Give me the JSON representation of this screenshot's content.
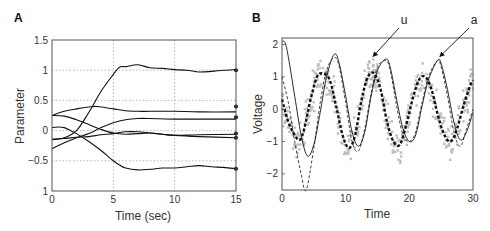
{
  "chart_data": [
    {
      "type": "line",
      "panel_label": "A",
      "title": "",
      "xlabel": "Time (sec)",
      "ylabel": "Parameter",
      "xlim": [
        0,
        15
      ],
      "ylim": [
        -1,
        1.5
      ],
      "xticks": [
        0,
        5,
        10,
        15
      ],
      "xtick_labels": [
        "0",
        "5",
        "10",
        "15"
      ],
      "yticks": [
        -1,
        -0.5,
        0,
        0.5,
        1,
        1.5
      ],
      "ytick_labels": [
        "1",
        "−0.5",
        "0",
        "0.5",
        "1",
        "1.5"
      ],
      "grid": true,
      "series": [
        {
          "name": "p1",
          "x": [
            0,
            1,
            2,
            3,
            4,
            5,
            5.5,
            6,
            7,
            8,
            9,
            10,
            11,
            12,
            13,
            14,
            15
          ],
          "y": [
            -0.15,
            -0.12,
            0.0,
            0.3,
            0.65,
            0.93,
            1.05,
            1.06,
            1.09,
            1.04,
            1.03,
            1.01,
            1.0,
            0.97,
            0.98,
            1.0,
            1.01
          ],
          "final": 1.0
        },
        {
          "name": "p2",
          "x": [
            0,
            1,
            2,
            3,
            3.5,
            4,
            5,
            6,
            7,
            8,
            10,
            12,
            15
          ],
          "y": [
            0.25,
            0.32,
            0.36,
            0.39,
            0.4,
            0.39,
            0.36,
            0.33,
            0.32,
            0.32,
            0.32,
            0.31,
            0.31
          ],
          "final": 0.4
        },
        {
          "name": "p3",
          "x": [
            0,
            1,
            2,
            3,
            4,
            5,
            6,
            7,
            8,
            10,
            12,
            15
          ],
          "y": [
            -0.3,
            -0.2,
            -0.12,
            -0.05,
            0.05,
            0.13,
            0.18,
            0.2,
            0.2,
            0.19,
            0.19,
            0.19
          ],
          "final": 0.22
        },
        {
          "name": "p4",
          "x": [
            0,
            1,
            2,
            3,
            4,
            5,
            6,
            7,
            8,
            9,
            10,
            12,
            15
          ],
          "y": [
            0.25,
            0.24,
            0.18,
            0.1,
            0.02,
            -0.04,
            -0.06,
            -0.05,
            -0.04,
            -0.06,
            -0.08,
            -0.1,
            -0.12
          ],
          "final": -0.12
        },
        {
          "name": "p5",
          "x": [
            0,
            1,
            2,
            3,
            4,
            5,
            6,
            7,
            8,
            9,
            10,
            12,
            15
          ],
          "y": [
            -0.14,
            -0.13,
            -0.11,
            -0.1,
            -0.07,
            -0.05,
            -0.02,
            -0.02,
            -0.04,
            -0.06,
            -0.08,
            -0.07,
            -0.06
          ],
          "final": -0.05
        },
        {
          "name": "p6",
          "x": [
            0,
            0.5,
            1,
            1.5,
            2,
            3,
            4,
            5,
            5.5,
            6,
            7,
            8,
            9,
            10,
            11,
            12,
            13,
            14,
            15
          ],
          "y": [
            0.05,
            0.06,
            0.05,
            0.0,
            -0.05,
            -0.18,
            -0.33,
            -0.5,
            -0.57,
            -0.62,
            -0.65,
            -0.64,
            -0.62,
            -0.62,
            -0.6,
            -0.58,
            -0.6,
            -0.61,
            -0.63
          ],
          "final": -0.63
        }
      ]
    },
    {
      "type": "line",
      "panel_label": "B",
      "title": "",
      "xlabel": "Time",
      "ylabel": "Voltage",
      "xlim": [
        0,
        30
      ],
      "ylim": [
        -2.5,
        2.2
      ],
      "xticks": [
        0,
        10,
        20,
        30
      ],
      "xtick_labels": [
        "0",
        "10",
        "20",
        "30"
      ],
      "yticks": [
        -2,
        -1,
        0,
        1,
        2
      ],
      "ytick_labels": [
        "−2",
        "−1",
        "0",
        "1",
        "2"
      ],
      "grid": false,
      "annotations": [
        {
          "text": "u",
          "points_to": [
            14,
            1.6
          ]
        },
        {
          "text": "a",
          "points_to": [
            24.5,
            1.6
          ]
        }
      ],
      "series": [
        {
          "name": "a (solid)",
          "style": "solid-thin",
          "x": [
            0,
            0.5,
            1,
            2,
            3,
            4,
            5,
            6,
            7,
            8.2,
            9,
            10,
            11,
            12,
            13,
            14,
            15,
            16.3,
            17,
            18,
            19,
            20,
            21,
            22,
            23,
            24.4,
            25,
            26,
            27,
            28,
            29,
            30
          ],
          "y": [
            2.1,
            2.05,
            1.6,
            0.4,
            -0.8,
            -1.45,
            -1.1,
            -0.1,
            1.0,
            1.7,
            1.4,
            0.4,
            -0.7,
            -1.15,
            -0.7,
            0.4,
            1.2,
            1.55,
            1.3,
            0.3,
            -0.6,
            -1.0,
            -0.8,
            0.1,
            0.9,
            1.5,
            1.4,
            0.6,
            -0.4,
            -0.95,
            -0.7,
            -0.1
          ]
        },
        {
          "name": "a (dashed)",
          "style": "dashed-thin",
          "x": [
            0,
            1,
            2,
            3,
            3.8,
            5,
            6,
            7,
            8.2,
            9,
            10,
            11,
            12,
            13,
            14,
            15,
            16.3,
            17,
            18,
            19,
            20,
            21,
            22,
            23,
            24.4,
            25,
            26,
            27,
            28,
            29,
            30
          ],
          "y": [
            1.0,
            0.2,
            -1.0,
            -2.0,
            -2.5,
            -1.2,
            0.2,
            1.2,
            1.6,
            1.3,
            0.2,
            -1.0,
            -1.3,
            -0.6,
            0.5,
            1.3,
            1.5,
            1.2,
            0.1,
            -0.8,
            -1.0,
            -0.7,
            0.2,
            1.0,
            1.5,
            1.3,
            0.4,
            -0.7,
            -1.15,
            -0.6,
            0.0
          ]
        },
        {
          "name": "u (thick dashed)",
          "style": "dashed-thick",
          "x": [
            0,
            1,
            2,
            2.8,
            3.5,
            4.5,
            5.5,
            6.5,
            7.5,
            8.5,
            9.5,
            10.5,
            11.5,
            12.5,
            13.5,
            14.5,
            15.5,
            16.5,
            17.5,
            18.5,
            19.5,
            20.5,
            21.5,
            22.5,
            23.5,
            24.5,
            25.5,
            26.5,
            27.5,
            28.5,
            29.5,
            30
          ],
          "y": [
            0.3,
            -0.4,
            -0.8,
            -0.95,
            -0.6,
            0.3,
            1.0,
            1.1,
            0.9,
            0.1,
            -0.8,
            -1.2,
            -0.8,
            0.3,
            1.0,
            1.1,
            0.6,
            -0.4,
            -1.0,
            -1.1,
            -0.5,
            0.3,
            0.9,
            1.0,
            0.6,
            -0.2,
            -0.8,
            -1.0,
            -0.6,
            0.1,
            0.7,
            0.9
          ]
        },
        {
          "name": "data (gray dots)",
          "style": "scatter-gray",
          "note": "noisy samples scattered around u, approx ±0.5"
        }
      ]
    }
  ]
}
